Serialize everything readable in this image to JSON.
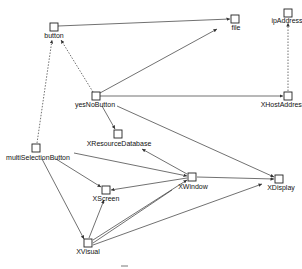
{
  "diagram": {
    "type": "directed-graph",
    "nodes": [
      {
        "id": "button",
        "label": "button",
        "x": 54,
        "y": 27
      },
      {
        "id": "file",
        "label": "file",
        "x": 235,
        "y": 19
      },
      {
        "id": "ipAddress",
        "label": "ipAddress",
        "x": 288,
        "y": 13
      },
      {
        "id": "yesNoButton",
        "label": "yesNoButton",
        "x": 96,
        "y": 96
      },
      {
        "id": "XHostAddress",
        "label": "XHostAddress",
        "x": 288,
        "y": 96
      },
      {
        "id": "XResourceDatabase",
        "label": "XResourceDatabase",
        "x": 118,
        "y": 134
      },
      {
        "id": "multiSelectionButton",
        "label": "multiSelectionButton",
        "x": 36,
        "y": 148
      },
      {
        "id": "XWindow",
        "label": "XWindow",
        "x": 192,
        "y": 177
      },
      {
        "id": "XDisplay",
        "label": "XDisplay",
        "x": 279,
        "y": 179
      },
      {
        "id": "XScreen",
        "label": "XScreen",
        "x": 106,
        "y": 190
      },
      {
        "id": "XVisual",
        "label": "XVisual",
        "x": 88,
        "y": 243
      }
    ],
    "edges": [
      {
        "from": "button",
        "to": "file",
        "style": "solid"
      },
      {
        "from": "yesNoButton",
        "to": "file",
        "style": "solid"
      },
      {
        "from": "yesNoButton",
        "to": "button",
        "style": "dashed"
      },
      {
        "from": "multiSelectionButton",
        "to": "button",
        "style": "dashed"
      },
      {
        "from": "yesNoButton",
        "to": "XHostAddress",
        "style": "solid"
      },
      {
        "from": "XHostAddress",
        "to": "ipAddress",
        "style": "dashed"
      },
      {
        "from": "yesNoButton",
        "to": "XResourceDatabase",
        "style": "solid"
      },
      {
        "from": "yesNoButton",
        "to": "XDisplay",
        "style": "solid"
      },
      {
        "from": "XWindow",
        "to": "XResourceDatabase",
        "style": "solid"
      },
      {
        "from": "multiSelectionButton",
        "to": "XWindow",
        "style": "solid"
      },
      {
        "from": "multiSelectionButton",
        "to": "XScreen",
        "style": "solid"
      },
      {
        "from": "multiSelectionButton",
        "to": "XVisual",
        "style": "solid"
      },
      {
        "from": "XWindow",
        "to": "XScreen",
        "style": "solid"
      },
      {
        "from": "XWindow",
        "to": "XDisplay",
        "style": "solid"
      },
      {
        "from": "XVisual",
        "to": "XScreen",
        "style": "solid"
      },
      {
        "from": "XVisual",
        "to": "XWindow",
        "style": "solid"
      },
      {
        "from": "XVisual",
        "to": "XDisplay",
        "style": "solid"
      }
    ]
  },
  "labels": {
    "button": "button",
    "file": "file",
    "ipAddress": "ipAddress",
    "yesNoButton": "yesNoButton",
    "XHostAddress": "XHostAddress",
    "XResourceDatabase": "XResourceDatabase",
    "multiSelectionButton": "multiSelectionButton",
    "XWindow": "XWindow",
    "XDisplay": "XDisplay",
    "XScreen": "XScreen",
    "XVisual": "XVisual"
  }
}
